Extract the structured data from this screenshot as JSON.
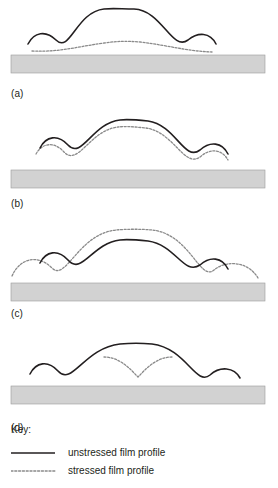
{
  "figure": {
    "panel_count": 4,
    "colors": {
      "solid_curve": "#231f20",
      "dashed_curve": "#8a8a8a",
      "substrate_fill": "#d2d2d2",
      "substrate_stroke": "#9a9a9a",
      "background": "#ffffff",
      "text": "#231f20"
    },
    "substrate": {
      "x": 11,
      "width": 254,
      "height": 18,
      "label": "substrate"
    },
    "panels": [
      {
        "id": "a",
        "label": "(a)",
        "top": 0,
        "label_y": 88,
        "substrate_y": 55,
        "solid": {
          "name": "unstressed film profile",
          "path": "M 28 44 C 34 32, 46 30, 56 40 C 70 54, 76 12, 104 9 C 112 8, 122 9, 134 9 C 162 10, 172 52, 188 40 C 198 32, 210 32, 216 44",
          "peak_y": 9,
          "trough_y": 45
        },
        "dashed": {
          "name": "stressed film profile",
          "path": "M 32 51 C 60 52, 70 48, 104 43 C 118 41, 128 41, 140 42 C 172 46, 186 51, 212 52",
          "peak_y": 41,
          "trough_y": 52
        }
      },
      {
        "id": "b",
        "label": "(b)",
        "top": 110,
        "label_y": 88,
        "substrate_y": 60,
        "solid": {
          "name": "unstressed film profile",
          "path": "M 40 38 C 46 26, 58 24, 68 35 C 82 50, 92 13, 120 10 C 128 9, 138 10, 148 11 C 176 15, 184 52, 200 40 C 210 31, 222 32, 228 44",
          "peak_y": 10,
          "trough_y": 45
        },
        "dashed": {
          "name": "stressed film profile",
          "path": "M 36 44 C 42 33, 54 31, 64 42 C 78 57, 90 20, 118 17 C 126 16, 136 17, 146 18 C 174 22, 184 58, 200 47 C 210 38, 222 39, 228 50",
          "peak_y": 17,
          "trough_y": 51
        }
      },
      {
        "id": "c",
        "top": 220,
        "label": "(c)",
        "label_y": 88,
        "substrate_y": 63,
        "solid": {
          "name": "unstressed film profile",
          "path": "M 40 43 C 46 31, 58 29, 68 40 C 82 56, 92 23, 120 20 C 128 19, 138 20, 148 21 C 176 25, 184 56, 200 45 C 210 36, 222 37, 228 49",
          "peak_y": 20,
          "trough_y": 50
        },
        "dashed": {
          "name": "stressed film profile",
          "path": "M 12 56 C 20 38, 38 34, 52 48 C 66 62, 78 14, 116 10 C 126 9, 142 9, 152 10 C 190 14, 200 62, 214 50 C 226 40, 248 41, 258 58",
          "peak_y": 9,
          "trough_y": 58
        }
      },
      {
        "id": "d",
        "top": 330,
        "label": "(d)",
        "label_y": 92,
        "substrate_y": 56,
        "solid": {
          "name": "unstressed film profile",
          "path": "M 30 44 C 36 32, 48 30, 58 41 C 72 57, 84 18, 120 14 C 130 13, 142 13, 152 14 C 186 18, 196 57, 210 45 C 220 36, 234 37, 240 48",
          "peak_y": 13,
          "trough_y": 48
        },
        "dashed": {
          "name": "stressed film profile",
          "path": "M 104 27 C 116 27, 126 34, 136 45 L 138 47 L 140 45 C 150 34, 160 27, 172 27",
          "notch_bottom_y": 47,
          "shape": "v-notch"
        }
      }
    ]
  },
  "key": {
    "title": "Key:",
    "entries": [
      {
        "style": "solid",
        "label": "unstressed film profile"
      },
      {
        "style": "dashed",
        "label": "stressed film profile"
      }
    ]
  }
}
